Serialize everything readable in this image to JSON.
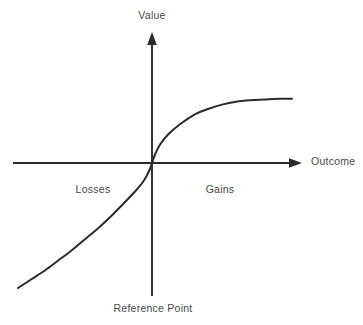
{
  "chart_data": {
    "type": "line",
    "title": "",
    "subtitle": "",
    "xlabel": "Outcome",
    "ylabel": "Value",
    "grid": false,
    "legend": null,
    "axes": {
      "origin_label": "Reference Point",
      "x_axis_label": "Outcome",
      "y_axis_label": "Value",
      "x_arrow": true,
      "y_arrow": true,
      "xlim": [
        -1.0,
        1.0
      ],
      "ylim": [
        -1.0,
        1.0
      ]
    },
    "annotations": [
      {
        "text": "Losses",
        "region": "x-negative"
      },
      {
        "text": "Gains",
        "region": "x-positive"
      },
      {
        "text": "Reference Point",
        "region": "origin"
      }
    ],
    "series": [
      {
        "name": "Prospect theory value function",
        "description": "S-shaped value function: concave for gains, convex and steeper for losses",
        "x": [
          -1.0,
          -0.9,
          -0.8,
          -0.7,
          -0.6,
          -0.5,
          -0.4,
          -0.3,
          -0.2,
          -0.12,
          -0.06,
          -0.02,
          0.0,
          0.02,
          0.06,
          0.12,
          0.2,
          0.3,
          0.4,
          0.5,
          0.6,
          0.7,
          0.8,
          0.9,
          1.0
        ],
        "y": [
          -1.0,
          -0.93,
          -0.86,
          -0.78,
          -0.7,
          -0.61,
          -0.52,
          -0.42,
          -0.31,
          -0.22,
          -0.14,
          -0.06,
          0.0,
          0.11,
          0.26,
          0.4,
          0.53,
          0.66,
          0.74,
          0.8,
          0.84,
          0.86,
          0.87,
          0.88,
          0.88
        ]
      }
    ],
    "colors": {
      "curve": "#2b2b2b",
      "axis": "#2b2b2b",
      "text": "#4a4a4a",
      "background": "#ffffff"
    }
  },
  "labels": {
    "value": "Value",
    "outcome": "Outcome",
    "losses": "Losses",
    "gains": "Gains",
    "reference_point": "Reference Point"
  }
}
